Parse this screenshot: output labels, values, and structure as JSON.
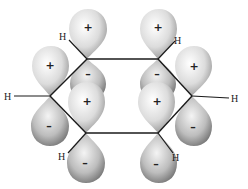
{
  "diagram": {
    "atoms": {
      "hydrogen_label": "H",
      "hydrogens": [
        {
          "id": "h-top-left",
          "label": "H",
          "x": 62,
          "y": 40
        },
        {
          "id": "h-top-right",
          "label": "H",
          "x": 175,
          "y": 42
        },
        {
          "id": "h-left",
          "label": "H",
          "x": 4,
          "y": 99
        },
        {
          "id": "h-right",
          "label": "H",
          "x": 232,
          "y": 101
        },
        {
          "id": "h-bottom-left",
          "label": "H",
          "x": 58,
          "y": 158
        },
        {
          "id": "h-bottom-right",
          "label": "H",
          "x": 174,
          "y": 159
        }
      ],
      "carbons": [
        {
          "id": "c-top-left",
          "x": 87,
          "y": 59
        },
        {
          "id": "c-top-right",
          "x": 158,
          "y": 59
        },
        {
          "id": "c-right",
          "x": 192,
          "y": 96
        },
        {
          "id": "c-bottom-right",
          "x": 158,
          "y": 133
        },
        {
          "id": "c-bottom-left",
          "x": 86,
          "y": 133
        },
        {
          "id": "c-left",
          "x": 50,
          "y": 96
        }
      ]
    },
    "lobe_signs": {
      "positive": "+",
      "negative": "–"
    },
    "colors": {
      "bond": "#1a1a1a",
      "lobe_light": "#ffffff",
      "lobe_mid": "#cfcfcf",
      "lobe_dark": "#7a7a7a",
      "background": "#ffffff"
    }
  }
}
